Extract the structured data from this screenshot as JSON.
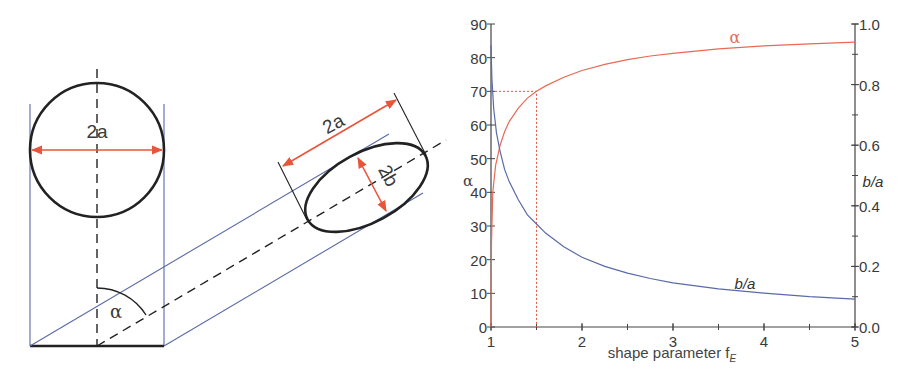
{
  "colors": {
    "outline": "#222222",
    "projection": "#5a6aa8",
    "dimension": "#e8553a",
    "alpha_curve": "#e86a55",
    "ratio_curve": "#5a6aa8",
    "axis": "#444444",
    "guide": "#e8553a"
  },
  "diagram": {
    "circle_label": "2a",
    "ellipse_major_label": "2a",
    "ellipse_minor_label": "2b",
    "angle_label": "α"
  },
  "chart_data": {
    "type": "line",
    "title": "",
    "xlabel": "shape parameter f",
    "xlabel_subscript": "E",
    "ylabel_left": "α",
    "ylabel_right": "b/a",
    "xlim": [
      1,
      5
    ],
    "ylim_left": [
      0,
      90
    ],
    "ylim_right": [
      0.0,
      1.0
    ],
    "x_ticks": [
      "1",
      "2",
      "3",
      "4",
      "5"
    ],
    "y_left_ticks": [
      "0",
      "10",
      "20",
      "30",
      "40",
      "50",
      "60",
      "70",
      "80",
      "90"
    ],
    "y_right_ticks": [
      "0.0",
      "0.2",
      "0.4",
      "0.6",
      "0.8",
      "1.0"
    ],
    "grid": false,
    "series": [
      {
        "name": "α",
        "axis": "left",
        "x": [
          1.0,
          1.005,
          1.02,
          1.05,
          1.1,
          1.15,
          1.2,
          1.3,
          1.4,
          1.5,
          1.6,
          1.8,
          2.0,
          2.25,
          2.5,
          2.75,
          3.0,
          3.5,
          4.0,
          4.5,
          5.0
        ],
        "y": [
          0,
          25,
          40,
          48,
          54,
          58,
          61,
          65,
          68,
          70,
          71.6,
          74.2,
          76.2,
          78.0,
          79.4,
          80.5,
          81.3,
          82.6,
          83.5,
          84.1,
          84.6
        ]
      },
      {
        "name": "b/a",
        "axis": "right",
        "x": [
          1.0,
          1.01,
          1.03,
          1.06,
          1.1,
          1.15,
          1.2,
          1.3,
          1.4,
          1.5,
          1.6,
          1.8,
          2.0,
          2.25,
          2.5,
          2.75,
          3.0,
          3.5,
          4.0,
          4.5,
          5.0
        ],
        "y": [
          0.93,
          0.82,
          0.72,
          0.64,
          0.58,
          0.52,
          0.48,
          0.42,
          0.37,
          0.34,
          0.31,
          0.265,
          0.23,
          0.2,
          0.178,
          0.16,
          0.146,
          0.126,
          0.112,
          0.1,
          0.092
        ]
      }
    ],
    "annotations": [
      {
        "text": "α",
        "x": 3.8,
        "y_left": 87.5,
        "series": "α"
      },
      {
        "text": "b/a",
        "x": 3.55,
        "y_right": 0.145,
        "series": "b/a"
      },
      {
        "type": "guide",
        "x": 1.5,
        "y_left": 70,
        "style": "dotted"
      }
    ]
  }
}
